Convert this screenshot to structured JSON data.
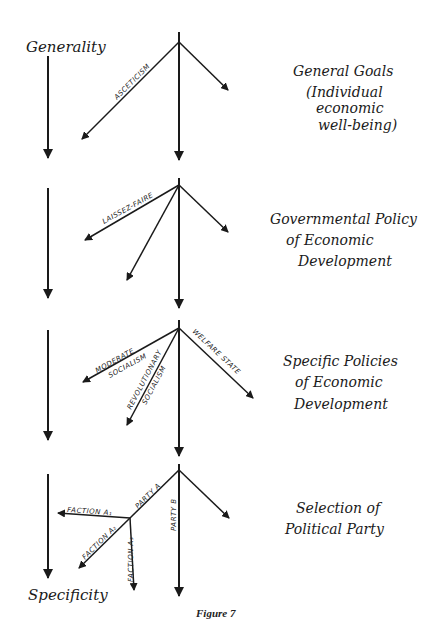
{
  "axis": {
    "top_label": "Generality",
    "bottom_label": "Specificity"
  },
  "levels": [
    {
      "id": "general-goals",
      "lines": [
        "General Goals",
        "(Individual",
        "economic",
        "well-being)"
      ]
    },
    {
      "id": "governmental-policy",
      "lines": [
        "Governmental Policy",
        "of Economic",
        "Development"
      ]
    },
    {
      "id": "specific-policies",
      "lines": [
        "Specific Policies",
        "of Economic",
        "Development"
      ]
    },
    {
      "id": "selection-party",
      "lines": [
        "Selection of",
        "Political Party"
      ]
    }
  ],
  "branch_labels": {
    "asceticism": "ASCETICISM",
    "laissez_faire": "LAISSEZ-FAIRE",
    "moderate": "MODERATE",
    "moderate_socialism": "SOCIALISM",
    "revolutionary": "REVOLUTIONARY",
    "revolutionary_socialism": "SOCIALISM",
    "welfare_state": "WELFARE STATE",
    "party_a": "PARTY A",
    "party_b": "PARTY B",
    "faction_a1": "FACTION A₁",
    "faction_a2": "FACTION A₂",
    "faction_a3": "FACTION A₃"
  },
  "caption": "Figure 7"
}
